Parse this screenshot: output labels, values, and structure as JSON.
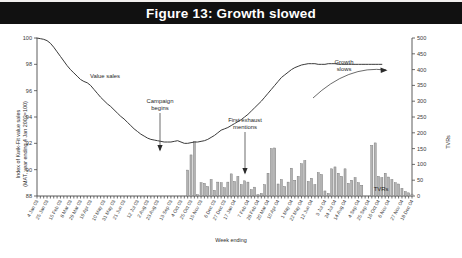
{
  "figure": {
    "title": "Figure 13: Growth slowed"
  },
  "chart_data": {
    "type": "bar",
    "title": "Figure 13: Growth slowed",
    "xlabel": "Week ending",
    "ylabel": "Index of Kwik-Fit value sales (MAT, year ending 4 Jan 2003=100)",
    "ylabel_line1": "Index of Kwik-Fit value sales",
    "ylabel_line2": "(MAT, year ending 4 Jan 2003=100)",
    "y2label": "TVRs",
    "ylim": [
      88,
      100
    ],
    "yticks": [
      88,
      90,
      92,
      94,
      96,
      98,
      100
    ],
    "y2lim": [
      0,
      500
    ],
    "y2ticks": [
      0,
      50,
      100,
      150,
      200,
      250,
      300,
      350,
      400,
      450,
      500
    ],
    "grid": false,
    "legend_position": "none",
    "xtick_labels": [
      "4 Jan 03",
      "25 Jan 03",
      "15 Feb 03",
      "8 Mar 03",
      "29 Mar 03",
      "19 Apr 03",
      "10 May 03",
      "31 May 03",
      "21 Jun 03",
      "12 Jul 03",
      "2 Aug 03",
      "23 Aug 03",
      "13 Sep 03",
      "4 Oct 03",
      "25 Oct 03",
      "15 Nov 03",
      "6 Dec 03",
      "27 Dec 03",
      "17 Jan 04",
      "7 Feb 04",
      "28 Feb 04",
      "20 Mar 04",
      "10 Apr 04",
      "1 May 04",
      "22 May 04",
      "12 Jun 04",
      "3 Jul 04",
      "24 Jul 04",
      "14 Aug 04",
      "4 Sep 04",
      "25 Sep 04",
      "16 Oct 04",
      "6 Nov 04",
      "27 Nov 04",
      "18 Dec 04"
    ],
    "series": [
      {
        "name": "Value sales",
        "type": "line",
        "axis": "left",
        "values": [
          100.0,
          99.95,
          99.9,
          99.8,
          99.6,
          99.3,
          98.95,
          98.6,
          98.25,
          97.9,
          97.6,
          97.35,
          97.1,
          96.85,
          96.7,
          96.6,
          96.4,
          96.1,
          95.8,
          95.5,
          95.25,
          95.0,
          94.8,
          94.55,
          94.3,
          94.05,
          93.85,
          93.6,
          93.35,
          93.1,
          92.9,
          92.7,
          92.55,
          92.4,
          92.3,
          92.25,
          92.2,
          92.15,
          92.1,
          92.1,
          92.1,
          92.15,
          92.2,
          92.1,
          92.0,
          92.0,
          92.05,
          92.1,
          92.1,
          92.15,
          92.2,
          92.3,
          92.45,
          92.6,
          92.8,
          93.0,
          93.1,
          93.2,
          93.35,
          93.5,
          93.65,
          93.8,
          94.0,
          94.2,
          94.45,
          94.7,
          94.95,
          95.2,
          95.5,
          95.8,
          96.1,
          96.4,
          96.7,
          97.0,
          97.2,
          97.4,
          97.6,
          97.75,
          97.85,
          97.95,
          98.0,
          98.05,
          98.05,
          98.05,
          98.0,
          98.0,
          98.0,
          98.05,
          98.05,
          98.05,
          98.0,
          98.0,
          98.0,
          98.0,
          98.0,
          98.0,
          98.0,
          98.0,
          98.0,
          98.0,
          98.0,
          98.0,
          98.0,
          98.0
        ]
      },
      {
        "name": "TVRs",
        "type": "bar",
        "axis": "right",
        "values": [
          0,
          0,
          0,
          0,
          0,
          0,
          0,
          0,
          0,
          0,
          0,
          0,
          0,
          0,
          0,
          0,
          0,
          0,
          0,
          0,
          0,
          0,
          0,
          0,
          0,
          0,
          0,
          0,
          0,
          0,
          0,
          0,
          0,
          0,
          0,
          0,
          0,
          0,
          0,
          0,
          0,
          0,
          0,
          0,
          0,
          82,
          130,
          172,
          4,
          42,
          40,
          30,
          52,
          18,
          44,
          42,
          26,
          44,
          70,
          46,
          62,
          36,
          48,
          44,
          20,
          28,
          4,
          8,
          36,
          72,
          150,
          152,
          38,
          52,
          30,
          44,
          88,
          50,
          62,
          102,
          112,
          46,
          56,
          36,
          74,
          68,
          16,
          8,
          86,
          92,
          72,
          62,
          86,
          40,
          50,
          58,
          42,
          34,
          0,
          0,
          160,
          168,
          62,
          58,
          72,
          60,
          52,
          42,
          38,
          24,
          14,
          10,
          6
        ]
      }
    ],
    "annotations": [
      {
        "text": "Value sales",
        "kind": "label"
      },
      {
        "text": "Campaign begins",
        "kind": "arrow-down"
      },
      {
        "text": "First exhaust mentions",
        "kind": "arrow-down"
      },
      {
        "text": "Growth slows",
        "kind": "arrow-curve"
      },
      {
        "text": "TVRs",
        "kind": "label"
      }
    ],
    "annotation_texts": {
      "value_sales": "Value sales",
      "campaign_begins_line1": "Campaign",
      "campaign_begins_line2": "begins",
      "first_exhaust_line1": "First exhaust",
      "first_exhaust_line2": "mentions",
      "growth_slows_line1": "Growth",
      "growth_slows_line2": "slows",
      "tvrs": "TVRs"
    }
  }
}
